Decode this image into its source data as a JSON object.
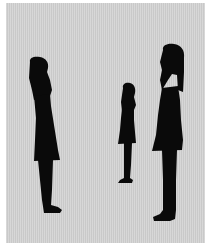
{
  "scene": {
    "description": "Three black silhouettes of women standing in profile, facing right and looking upward, on a light gray textured background",
    "background_color": "#cfcfcf",
    "border_color": "#ffffff",
    "silhouette_color": "#0a0a0a",
    "figures": [
      {
        "id": "left",
        "label": "woman silhouette (left, medium)"
      },
      {
        "id": "middle",
        "label": "woman silhouette (middle, small/distant)"
      },
      {
        "id": "right",
        "label": "woman silhouette (right, tall)"
      }
    ]
  }
}
